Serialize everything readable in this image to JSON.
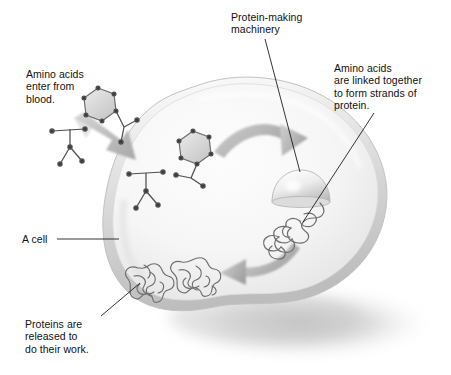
{
  "figure": {
    "kind": "biology-illustration",
    "style": "grayscale airbrush diagram",
    "background_color": "#ffffff",
    "ink_color": "#111111",
    "cell_fill_color": "#f7f7f7",
    "cell_rim_color": "#c9c9c9",
    "arrow_color": "#b0b0b0",
    "molecule_color": "#5a5a5a",
    "shadow_color": "#d0d0d0"
  },
  "labels": {
    "amino_acids_enter": {
      "line1": "Amino acids",
      "line2": "enter from",
      "line3": "blood."
    },
    "protein_machinery": {
      "line1": "Protein-making",
      "line2": "machinery"
    },
    "amino_acids_linked": {
      "line1": "Amino acids",
      "line2": "are linked together",
      "line3": "to form strands of",
      "line4": "protein."
    },
    "a_cell": {
      "line1": "A cell"
    },
    "proteins_released": {
      "line1": "Proteins are",
      "line2": "released to",
      "line3": "do their work."
    }
  },
  "elements": {
    "cell": "cell-body",
    "ribosome": "ribosome-dome",
    "protein_strand": "nascent-protein-strand",
    "folded_proteins": [
      "folded-protein-1",
      "folded-protein-2"
    ],
    "amino_acids_outside": [
      "amino-acid-hexagon-outer",
      "amino-acid-stick-outer"
    ],
    "amino_acids_inside": [
      "amino-acid-hexagon-inner",
      "amino-acid-stick-inner"
    ],
    "arrows": [
      "entry-arrow",
      "uptake-curved-arrow",
      "release-curved-arrow"
    ]
  }
}
